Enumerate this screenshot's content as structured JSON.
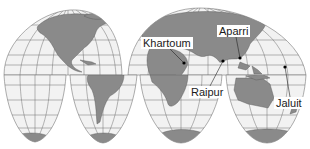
{
  "map": {
    "projection": "interrupted-homolosine",
    "colors": {
      "ocean": "#f2f2f2",
      "land": "#8a8a8a",
      "graticule": "#6e6e6e",
      "background": "#ffffff",
      "dot": "#000000"
    },
    "places": [
      {
        "name": "Khartoum",
        "label_x": 141,
        "label_y": 37,
        "dot_x": 184,
        "dot_y": 63
      },
      {
        "name": "Aparri",
        "label_x": 217,
        "label_y": 25,
        "dot_x": 240,
        "dot_y": 58
      },
      {
        "name": "Raipur",
        "label_x": 189,
        "label_y": 86,
        "dot_x": 223,
        "dot_y": 61
      },
      {
        "name": "Jaluit",
        "label_x": 274,
        "label_y": 97,
        "dot_x": 285,
        "dot_y": 67
      }
    ]
  }
}
